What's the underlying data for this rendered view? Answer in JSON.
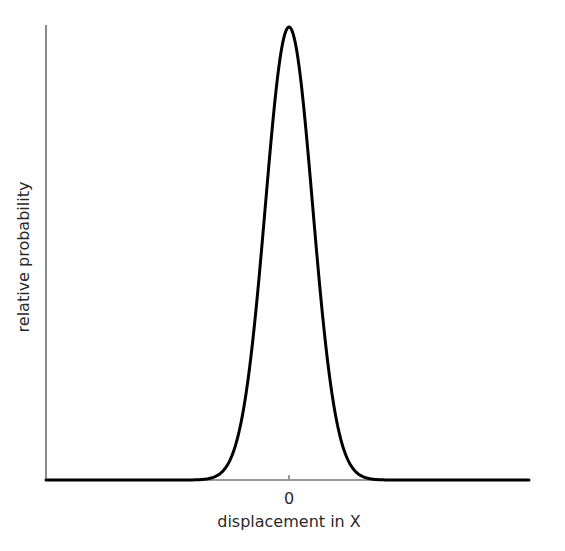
{
  "chart_data": {
    "type": "line",
    "title": "",
    "xlabel": "displacement in X",
    "ylabel": "relative probability",
    "x_ticks": [
      "0"
    ],
    "grid": false,
    "legend": null,
    "series": [
      {
        "name": "gaussian displacement distribution",
        "shape": "gaussian",
        "mean": 0,
        "sigma_relative_to_axis_halfwidth": 0.098,
        "peak_relative": 1.0,
        "x": [
          -10,
          -4,
          -3,
          -2,
          -1.5,
          -1,
          -0.5,
          0,
          0.5,
          1,
          1.5,
          2,
          3,
          4,
          10
        ],
        "values": [
          0,
          0.0003,
          0.011,
          0.135,
          0.325,
          0.607,
          0.882,
          1.0,
          0.882,
          0.607,
          0.325,
          0.135,
          0.011,
          0.0003,
          0
        ],
        "x_units": "sigma"
      }
    ],
    "colors": {
      "curve": "#000000",
      "axes": "#8a8a8a",
      "baseline": "#111111",
      "text": "#2a2a2a"
    }
  },
  "axes": {
    "x_axis_label": "displacement in X",
    "y_axis_label": "relative probability",
    "x_tick_zero": "0"
  }
}
